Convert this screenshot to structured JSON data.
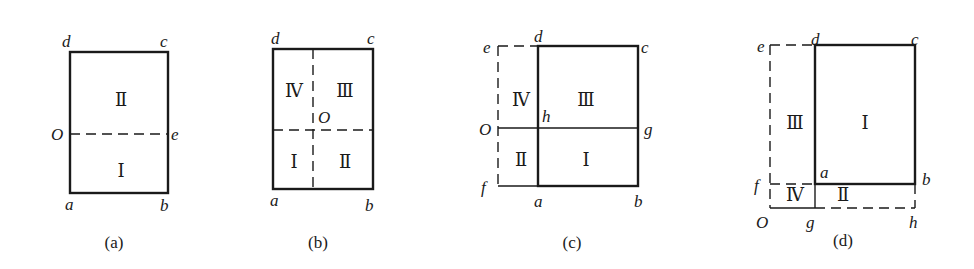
{
  "figures": [
    {
      "id": "a",
      "caption": "(a)",
      "points": {
        "d": "d",
        "c": "c",
        "O": "O",
        "e": "e",
        "a": "a",
        "b": "b"
      },
      "regions": [
        "Ⅱ",
        "Ⅰ"
      ]
    },
    {
      "id": "b",
      "caption": "(b)",
      "points": {
        "d": "d",
        "c": "c",
        "O": "O",
        "a": "a",
        "b": "b"
      },
      "regions": [
        "Ⅳ",
        "Ⅲ",
        "Ⅰ",
        "Ⅱ"
      ]
    },
    {
      "id": "c",
      "caption": "(c)",
      "points": {
        "e": "e",
        "d": "d",
        "c": "c",
        "O": "O",
        "h": "h",
        "g": "g",
        "f": "f",
        "a": "a",
        "b": "b"
      },
      "regions": [
        "Ⅳ",
        "Ⅲ",
        "Ⅱ",
        "Ⅰ"
      ]
    },
    {
      "id": "d",
      "caption": "(d)",
      "points": {
        "e": "e",
        "d": "d",
        "c": "c",
        "f": "f",
        "a": "a",
        "b": "b",
        "O": "O",
        "g": "g",
        "h": "h"
      },
      "regions": [
        "Ⅲ",
        "Ⅰ",
        "Ⅳ",
        "Ⅱ"
      ]
    }
  ]
}
